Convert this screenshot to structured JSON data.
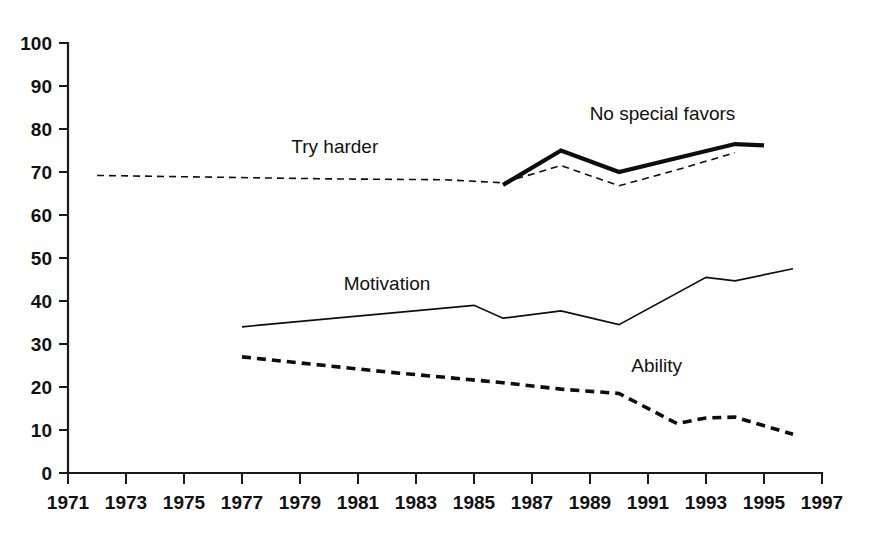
{
  "chart_data": {
    "type": "line",
    "title": "",
    "subtitle": "",
    "xlabel": "",
    "ylabel": "",
    "xlim": [
      1971,
      1997
    ],
    "ylim": [
      0,
      100
    ],
    "grid": false,
    "legend_position": "inline-labels",
    "x_ticks": [
      1971,
      1973,
      1975,
      1977,
      1979,
      1981,
      1983,
      1985,
      1987,
      1989,
      1991,
      1993,
      1995,
      1997
    ],
    "y_ticks": [
      0,
      10,
      20,
      30,
      40,
      50,
      60,
      70,
      80,
      90,
      100
    ],
    "x_tick_labels": [
      "1971",
      "1973",
      "1975",
      "1977",
      "1979",
      "1981",
      "1983",
      "1985",
      "1987",
      "1989",
      "1991",
      "1993",
      "1995",
      "1997"
    ],
    "y_tick_labels": [
      "0",
      "10",
      "20",
      "30",
      "40",
      "50",
      "60",
      "70",
      "80",
      "90",
      "100"
    ],
    "series": [
      {
        "name": "Try harder",
        "style": "thin-dashed",
        "stroke_width": 1.6,
        "dash": "7,5",
        "label": "Try harder",
        "label_x": 1980.2,
        "label_y": 74.5,
        "x": [
          1972,
          1974,
          1976,
          1978,
          1980,
          1982,
          1984,
          1986,
          1988,
          1990,
          1992,
          1994
        ],
        "y": [
          69.2,
          69.0,
          68.8,
          68.6,
          68.4,
          68.3,
          68.2,
          67.5,
          71.5,
          66.8,
          70.5,
          74.5
        ]
      },
      {
        "name": "No special favors",
        "style": "thick-solid",
        "stroke_width": 4.2,
        "dash": "none",
        "label": "No special favors",
        "label_x": 1991.5,
        "label_y": 82.0,
        "x": [
          1986,
          1988,
          1990,
          1994,
          1995
        ],
        "y": [
          67.0,
          75.0,
          70.0,
          76.5,
          76.2
        ]
      },
      {
        "name": "Motivation",
        "style": "thin-solid",
        "stroke_width": 1.7,
        "dash": "none",
        "label": "Motivation",
        "label_x": 1982.0,
        "label_y": 42.5,
        "x": [
          1977,
          1985,
          1986,
          1988,
          1990,
          1993,
          1994,
          1996
        ],
        "y": [
          34.0,
          39.0,
          36.0,
          37.7,
          34.5,
          45.5,
          44.7,
          47.5
        ]
      },
      {
        "name": "Ability",
        "style": "thick-dashed",
        "stroke_width": 3.6,
        "dash": "9,6",
        "label": "Ability",
        "label_x": 1991.3,
        "label_y": 23.5,
        "x": [
          1977,
          1982,
          1986,
          1988,
          1990,
          1992,
          1993,
          1994,
          1996
        ],
        "y": [
          27.0,
          23.5,
          21.0,
          19.5,
          18.5,
          11.5,
          12.8,
          13.0,
          9.0
        ]
      }
    ],
    "colors": {
      "axis": "#1a1a1a",
      "line": "#0d0d0d",
      "text": "#111111",
      "background": "#ffffff"
    }
  }
}
